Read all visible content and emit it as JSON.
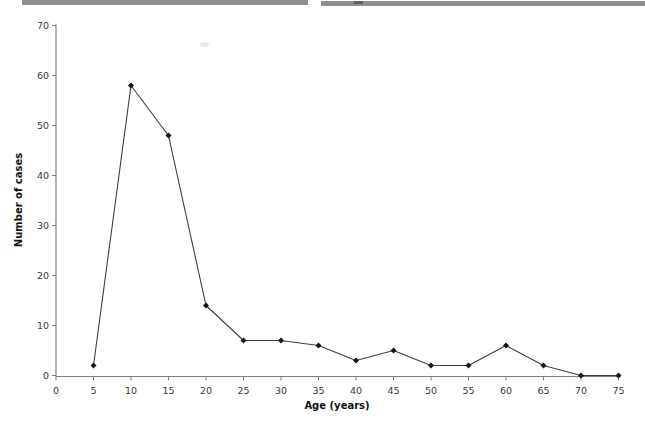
{
  "artifacts": {
    "top_rule_color": "#8f8f8f",
    "notch_color": "#606060"
  },
  "chart_data": {
    "type": "line",
    "title": "",
    "xlabel": "Age (years)",
    "ylabel": "Number of cases",
    "x": [
      5,
      10,
      15,
      20,
      25,
      30,
      35,
      40,
      45,
      50,
      55,
      60,
      65,
      70,
      75
    ],
    "values": [
      2,
      58,
      48,
      14,
      7,
      7,
      6,
      3,
      5,
      2,
      2,
      6,
      2,
      0,
      0
    ],
    "xlim": [
      0,
      75
    ],
    "ylim": [
      0,
      70
    ],
    "x_ticks": [
      0,
      5,
      10,
      15,
      20,
      25,
      30,
      35,
      40,
      45,
      50,
      55,
      60,
      65,
      70,
      75
    ],
    "y_ticks": [
      0,
      10,
      20,
      30,
      40,
      50,
      60,
      70
    ],
    "grid": false,
    "legend": "none",
    "marker": "diamond",
    "colors": {
      "line": "#3f3f3f",
      "marker": "#161616",
      "axis": "#7f7f7f",
      "tick_label": "#3a3a3a",
      "axis_title": "#111111"
    }
  }
}
